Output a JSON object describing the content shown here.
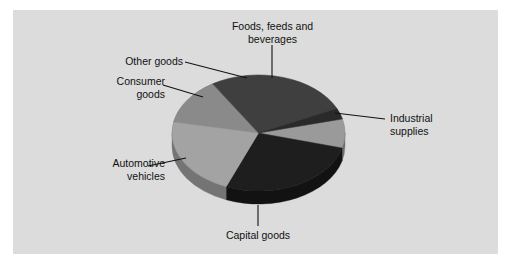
{
  "figure": {
    "background_color": "#ffffff",
    "panel_color": "#dcdcdc",
    "label_color": "#111111",
    "leader_color": "#111111"
  },
  "chart_data": {
    "type": "pie",
    "title": "",
    "subtitle": "",
    "xlabel": "",
    "ylabel": "",
    "grid": false,
    "legend_position": "none",
    "label_style": "outside-callout-leader-lines",
    "three_d": true,
    "categories": [
      "Foods, feeds and beverages",
      "Industrial supplies",
      "Capital goods",
      "Automotive vehicles",
      "Consumer goods",
      "Other goods"
    ],
    "values": [
      8,
      27,
      22,
      13,
      27,
      3
    ],
    "units": "percent of total",
    "slices": [
      {
        "label": "Foods, feeds and beverages",
        "label_line1": "Foods, feeds and",
        "label_line2": "beverages",
        "value": 8,
        "color": "#9a9a9a",
        "side_color": "#6e6e6e",
        "start_angle": -14,
        "end_angle": 15
      },
      {
        "label": "Industrial supplies",
        "label_line1": "Industrial",
        "label_line2": "supplies",
        "value": 27,
        "color": "#1e1e1e",
        "side_color": "#121212",
        "start_angle": 15,
        "end_angle": 112
      },
      {
        "label": "Capital goods",
        "label_line1": "Capital goods",
        "label_line2": "",
        "value": 22,
        "color": "#a3a3a3",
        "side_color": "#747474",
        "start_angle": 112,
        "end_angle": 191
      },
      {
        "label": "Automotive vehicles",
        "label_line1": "Automotive",
        "label_line2": "vehicles",
        "value": 13,
        "color": "#8a8a8a",
        "side_color": "#616161",
        "start_angle": 191,
        "end_angle": 238
      },
      {
        "label": "Consumer goods",
        "label_line1": "Consumer",
        "label_line2": "goods",
        "value": 27,
        "color": "#3f3f3f",
        "side_color": "#2b2b2b",
        "start_angle": 238,
        "end_angle": 335
      },
      {
        "label": "Other goods",
        "label_line1": "Other goods",
        "label_line2": "",
        "value": 3,
        "color": "#2a2a2a",
        "side_color": "#1c1c1c",
        "start_angle": 335,
        "end_angle": 346
      }
    ]
  },
  "labels": {
    "foods": "Foods, feeds and\nbeverages",
    "industrial": "Industrial\nsupplies",
    "capital": "Capital goods",
    "automotive": "Automotive\nvehicles",
    "consumer": "Consumer\ngoods",
    "other": "Other goods"
  }
}
